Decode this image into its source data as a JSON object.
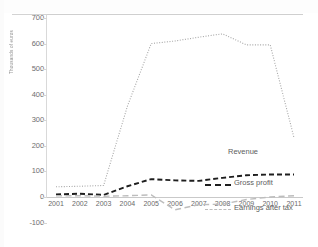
{
  "chart_data": {
    "type": "line",
    "title": "",
    "subtitle": "",
    "xlabel": "",
    "ylabel": "Thousands of euros",
    "categories": [
      "2001",
      "2002",
      "2003",
      "2004",
      "2005",
      "2006",
      "2007",
      "2008",
      "2009",
      "2010",
      "2011"
    ],
    "series": [
      {
        "name": "Revenue",
        "style": "dotted",
        "color": "#a6a6a6",
        "values": [
          40,
          42,
          45,
          355,
          600,
          610,
          625,
          638,
          595,
          595,
          232
        ]
      },
      {
        "name": "Gross profit",
        "style": "dashed",
        "color": "#1e1e1e",
        "values": [
          10,
          13,
          8,
          42,
          70,
          65,
          63,
          75,
          85,
          88,
          88
        ]
      },
      {
        "name": "Earnings after tax",
        "style": "dashed",
        "color": "#bdbdbd",
        "values": [
          5,
          5,
          3,
          5,
          8,
          -50,
          -30,
          -28,
          -10,
          0,
          5
        ]
      }
    ],
    "ylim": [
      -100,
      700
    ],
    "yticks": [
      700,
      600,
      500,
      400,
      300,
      200,
      100,
      0,
      -100
    ],
    "ytick_labels": [
      "700",
      "600",
      "500",
      "400",
      "300",
      "200",
      "100",
      "0",
      "-100"
    ],
    "grid": false,
    "legend_position": "inline-right",
    "zero_line": true
  },
  "labels": {
    "revenue": "Revenue",
    "gross_profit": "Gross profit",
    "earnings_after_tax": "Earnings after tax"
  },
  "axis": {
    "y_title": "Thousands of euros"
  }
}
